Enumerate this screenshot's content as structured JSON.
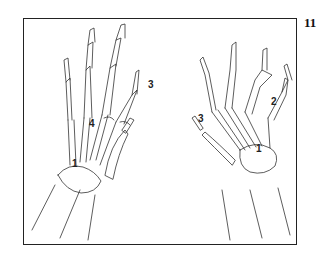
{
  "figure": {
    "number": "11",
    "labels": [
      {
        "text": "1",
        "x": 74,
        "y": 165
      },
      {
        "text": "4",
        "x": 91,
        "y": 125
      },
      {
        "text": "3",
        "x": 149,
        "y": 79
      },
      {
        "text": "3",
        "x": 199,
        "y": 117
      },
      {
        "text": "2",
        "x": 273,
        "y": 99
      },
      {
        "text": "1",
        "x": 257,
        "y": 145
      }
    ]
  }
}
